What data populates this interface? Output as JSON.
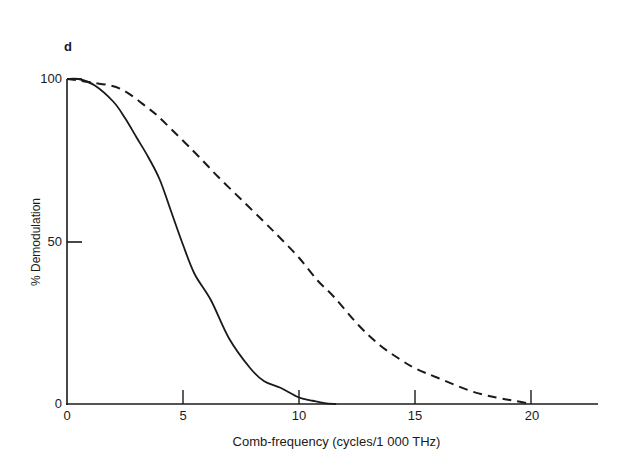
{
  "panel_label": "d",
  "chart_data": {
    "type": "line",
    "title": "",
    "panel": "d",
    "xlabel": "Comb-frequency (cycles/1 000 THz)",
    "ylabel": "% Demodulation",
    "xlim": [
      0,
      22.8
    ],
    "ylim": [
      0,
      100
    ],
    "xticks": [
      0,
      5,
      10,
      15,
      20
    ],
    "xtick_labels": [
      "0",
      "5",
      "10",
      "15",
      "20"
    ],
    "yticks": [
      0,
      50,
      100
    ],
    "ytick_labels": [
      "0",
      "50",
      "100"
    ],
    "grid": false,
    "legend": null,
    "series": [
      {
        "name": "solid curve",
        "style": "solid",
        "x": [
          0,
          0.5,
          1.2,
          2.0,
          2.5,
          3.0,
          3.5,
          4.0,
          4.5,
          5.0,
          5.5,
          6.2,
          7.0,
          7.9,
          8.5,
          9.2,
          10.0,
          10.6,
          11.1,
          11.6
        ],
        "y": [
          100,
          100,
          98,
          93,
          88,
          82,
          76,
          69,
          59,
          49,
          40,
          32,
          20,
          11,
          7,
          5,
          2,
          1,
          0.3,
          0
        ]
      },
      {
        "name": "dashed curve",
        "style": "dashed",
        "x": [
          0,
          1.0,
          2.3,
          3.5,
          4.0,
          5.0,
          5.7,
          6.5,
          7.5,
          8.5,
          9.2,
          10.0,
          10.8,
          11.5,
          12.6,
          13.5,
          14.3,
          15.0,
          16.0,
          17.4,
          18.5,
          19.3,
          20.0
        ],
        "y": [
          100,
          99,
          97,
          91,
          88,
          81,
          76,
          70,
          63,
          56,
          51,
          45,
          38,
          33,
          24,
          18,
          14,
          11,
          8,
          4,
          2,
          1,
          0
        ]
      }
    ]
  }
}
